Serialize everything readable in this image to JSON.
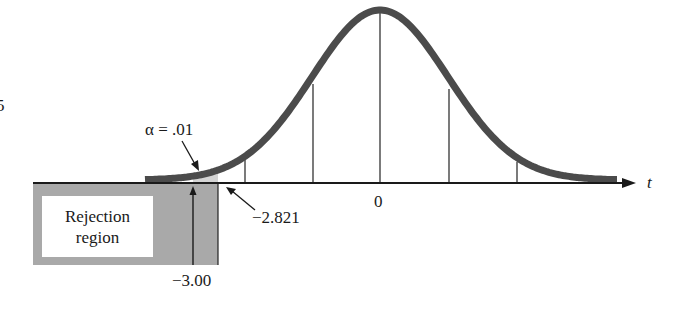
{
  "chart_data": {
    "type": "area",
    "title": "",
    "xlabel": "t",
    "ylabel": "",
    "distribution": "t-distribution (bell curve)",
    "x_ticks_labels": [
      "0"
    ],
    "x_tick_positions_in_sd": [
      -2,
      -1,
      0,
      1,
      2
    ],
    "rejection_region": {
      "label_line1": "Rejection",
      "label_line2": "region",
      "critical_value": "-2.821",
      "test_statistic": "-3.00",
      "alpha": "α = .01",
      "tail": "left"
    },
    "annotations": [
      "α = .01",
      "−2.821",
      "−3.00",
      "0",
      "t"
    ],
    "grid": false,
    "legend": "none"
  },
  "labels": {
    "alpha": "α = .01",
    "critical": "−2.821",
    "statistic": "−3.00",
    "zero": "0",
    "axis": "t",
    "rejection_line1": "Rejection",
    "rejection_line2": "region",
    "edge_fragment": "5"
  },
  "colors": {
    "curve": "#4a4a4a",
    "region_fill": "#a8a8a8",
    "tail_fill": "#d6d6d6",
    "axis": "#1a1a1a"
  }
}
